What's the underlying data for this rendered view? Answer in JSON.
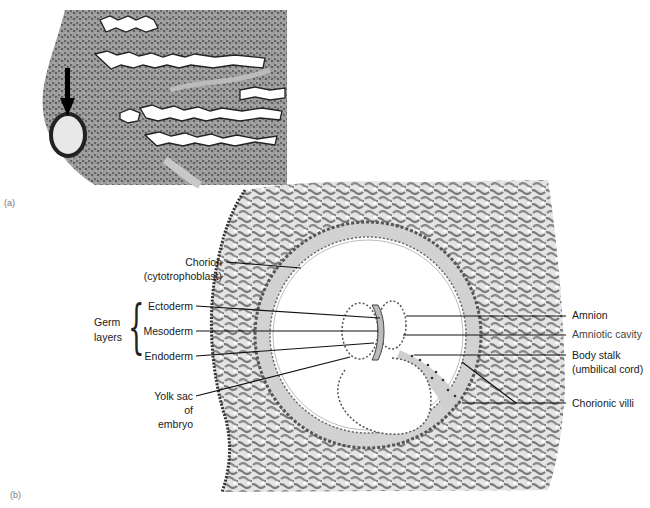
{
  "panels": {
    "a": {
      "label": "(a)"
    },
    "b": {
      "label": "(b)"
    }
  },
  "labels": {
    "chorion": "Chorion",
    "chorion_sub": "(cytotrophoblast)",
    "germ_layers_1": "Germ",
    "germ_layers_2": "layers",
    "ectoderm": "Ectoderm",
    "mesoderm": "Mesoderm",
    "endoderm": "Endoderm",
    "yolk_1": "Yolk sac",
    "yolk_2": "of",
    "yolk_3": "embryo",
    "amnion": "Amnion",
    "amniotic_cavity": "Amniotic cavity",
    "body_stalk": "Body stalk",
    "body_stalk_sub": "(umbilical cord)",
    "chorionic_villi": "Chorionic villi"
  },
  "icons": {
    "arrow": "down-arrow-icon"
  },
  "colors": {
    "tissue_light": "#dcdcdc",
    "tissue_dark": "#4a4a4a",
    "line": "#111111"
  }
}
